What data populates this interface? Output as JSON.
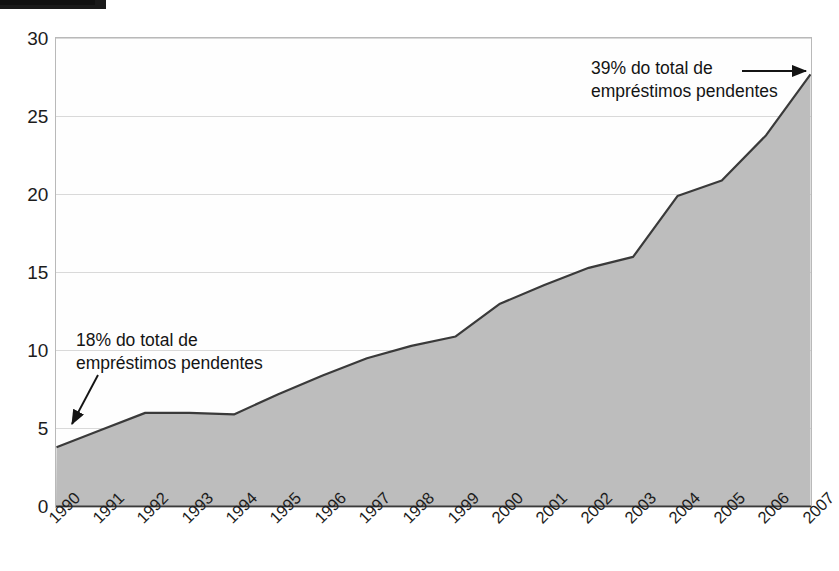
{
  "figure": {
    "kind": "area-chart",
    "background": "#ffffff",
    "top_rule_color": "#1a1a1a"
  },
  "axes": {
    "y_ticks": [
      "30",
      "25",
      "20",
      "15",
      "10",
      "5",
      "0"
    ],
    "x_ticks": [
      "1990",
      "1991",
      "1992",
      "1993",
      "1994",
      "1995",
      "1996",
      "1997",
      "1998",
      "1999",
      "2000",
      "2001",
      "2002",
      "2003",
      "2004",
      "2005",
      "2006",
      "2007"
    ]
  },
  "annotations": {
    "left": {
      "line1": "18% do total de",
      "line2": "empréstimos pendentes",
      "arrow": "arrow-down-left"
    },
    "right": {
      "line1": "39% do total de",
      "line2": "empréstimos pendentes",
      "arrow": "arrow-right"
    }
  },
  "style": {
    "area_fill": "#bdbdbd",
    "area_stroke": "#3a3a3a",
    "grid_color": "#d9d9d9",
    "frame_color": "#b9b9b9",
    "text_color": "#1c1c1c"
  },
  "chart_data": {
    "type": "area",
    "title": "",
    "subtitle": "",
    "xlabel": "",
    "ylabel": "",
    "xlim": [
      "1990",
      "2007"
    ],
    "ylim": [
      0,
      30
    ],
    "y_tick_values": [
      0,
      5,
      10,
      15,
      20,
      25,
      30
    ],
    "grid": true,
    "grid_axis": "y",
    "legend": false,
    "legend_position": "none",
    "categories": [
      "1990",
      "1991",
      "1992",
      "1993",
      "1994",
      "1995",
      "1996",
      "1997",
      "1998",
      "1999",
      "2000",
      "2001",
      "2002",
      "2003",
      "2004",
      "2005",
      "2006",
      "2007"
    ],
    "values": [
      3.8,
      4.9,
      6.0,
      6.0,
      5.9,
      7.2,
      8.4,
      9.5,
      10.3,
      10.9,
      13.0,
      14.2,
      15.3,
      16.0,
      19.9,
      20.9,
      23.8,
      27.7
    ],
    "annotations": [
      {
        "text": "18% do total de empréstimos pendentes",
        "at_category": "1990",
        "at_value": 3.8
      },
      {
        "text": "39% do total de empréstimos pendentes",
        "at_category": "2007",
        "at_value": 27.7
      }
    ]
  }
}
